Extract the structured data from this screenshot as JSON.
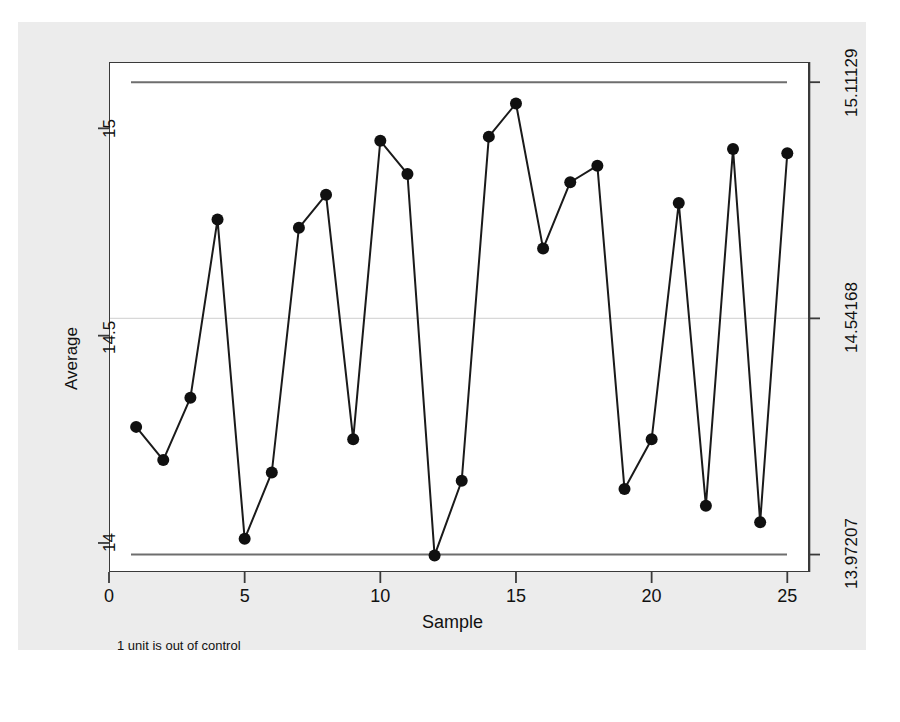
{
  "chart_data": {
    "type": "line",
    "title": "",
    "subtitle": "",
    "xlabel": "Sample",
    "ylabel": "Average",
    "xlim": [
      0,
      25.8
    ],
    "ylim": [
      13.93,
      15.16
    ],
    "grid": false,
    "legend_position": "none",
    "x": [
      1,
      2,
      3,
      4,
      5,
      6,
      7,
      8,
      9,
      10,
      11,
      12,
      13,
      14,
      15,
      16,
      17,
      18,
      19,
      20,
      21,
      22,
      23,
      24,
      25
    ],
    "series": [
      {
        "name": "Average",
        "marker": "filled-circle",
        "values": [
          14.28,
          14.2,
          14.35,
          14.78,
          14.01,
          14.17,
          14.76,
          14.84,
          14.25,
          14.97,
          14.89,
          13.97,
          14.15,
          14.98,
          15.06,
          14.71,
          14.87,
          14.91,
          14.13,
          14.25,
          14.82,
          14.09,
          14.95,
          14.05,
          14.94
        ]
      }
    ],
    "reference_lines": [
      {
        "name": "upper-control-limit",
        "value": 15.11129,
        "style": "solid",
        "color": "#6e6e6e"
      },
      {
        "name": "center-line",
        "value": 14.54168,
        "style": "solid",
        "color": "#d8d8d8"
      },
      {
        "name": "lower-control-limit",
        "value": 13.97207,
        "style": "solid",
        "color": "#6e6e6e"
      }
    ],
    "xticks": [
      {
        "value": 0,
        "label": "0"
      },
      {
        "value": 5,
        "label": "5"
      },
      {
        "value": 10,
        "label": "10"
      },
      {
        "value": 15,
        "label": "15"
      },
      {
        "value": 20,
        "label": "20"
      },
      {
        "value": 25,
        "label": "25"
      }
    ],
    "yticks_left": [
      {
        "value": 15,
        "label": "15"
      },
      {
        "value": 14.5,
        "label": "14.5"
      },
      {
        "value": 14,
        "label": "14"
      }
    ],
    "yticks_right": [
      {
        "value": 15.11129,
        "label": "15.11129"
      },
      {
        "value": 14.54168,
        "label": "14.54168"
      },
      {
        "value": 13.97207,
        "label": "13.97207"
      }
    ],
    "annotations": [
      {
        "name": "out-of-control-note",
        "text": "1 unit is out of control"
      }
    ],
    "out_of_control_points": [
      12
    ]
  },
  "axes": {
    "y_left_title": "Average",
    "x_title": "Sample",
    "y_left_ticks": [
      "15",
      "14.5",
      "14"
    ],
    "y_right_ticks": [
      "15.11129",
      "14.54168",
      "13.97207"
    ],
    "x_ticks": [
      "0",
      "5",
      "10",
      "15",
      "20",
      "25"
    ]
  },
  "footnote": {
    "text": "1 unit is out of control"
  },
  "colors": {
    "figure_background": "#ececec",
    "plot_background": "#ffffff",
    "line": "#1a1a1a",
    "marker": "#101010",
    "control_limit": "#6e6e6e",
    "center_line": "#dcdcdc",
    "axis": "#3a3a3a",
    "text": "#111111"
  }
}
